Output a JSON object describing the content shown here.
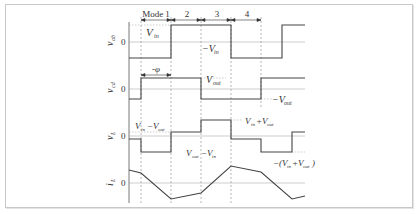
{
  "figure": {
    "modes": [
      {
        "label": "Mode 1",
        "x1": 141,
        "x2": 171
      },
      {
        "label": "2",
        "x1": 171,
        "x2": 201
      },
      {
        "label": "3",
        "x1": 201,
        "x2": 231
      },
      {
        "label": "4",
        "x1": 231,
        "x2": 261
      }
    ],
    "phase_label": "-φ",
    "zero_label": "0",
    "traces": [
      {
        "name": "v_ab",
        "axis_label": "v",
        "axis_sub": "ab",
        "annotations": [
          "V_in",
          "−V_in"
        ]
      },
      {
        "name": "v_cd",
        "axis_label": "v",
        "axis_sub": "cd",
        "annotations": [
          "V_out",
          "−V_out"
        ]
      },
      {
        "name": "v_L",
        "axis_label": "v",
        "axis_sub": "L",
        "annotations": [
          "V_in−V_out",
          "V_out−V_in",
          "V_in+V_out",
          "−(V_in+V_out)"
        ]
      },
      {
        "name": "i_L",
        "axis_label": "i",
        "axis_sub": "L",
        "annotations": []
      }
    ],
    "text": {
      "mode1": "Mode 1",
      "mode2": "2",
      "mode3": "3",
      "mode4": "4",
      "phi": "-φ",
      "vin_main": "V",
      "vin_sub": "in",
      "neg_vin": "−V",
      "vout_main": "V",
      "vout_sub": "out",
      "neg_vout": "−V",
      "vin_minus_vout_a": "V",
      "vin_minus_vout_sub1": "in",
      "vin_minus_vout_op": "−V",
      "vin_minus_vout_sub2": "out",
      "vout_minus_vin_a": "V",
      "vout_minus_vin_sub1": "out",
      "vout_minus_vin_op": "−V",
      "vout_minus_vin_sub2": "in",
      "vin_plus_vout_a": "V",
      "vin_plus_vout_sub1": "in",
      "vin_plus_vout_op": "+V",
      "vin_plus_vout_sub2": "out",
      "neg_sum_pre": "−(V",
      "neg_sum_sub1": "in",
      "neg_sum_op": "+V",
      "neg_sum_sub2": "out",
      "neg_sum_post": ")",
      "zero": "0",
      "v": "v",
      "i": "i",
      "ab": "ab",
      "cd": "cd",
      "L": "L"
    }
  }
}
